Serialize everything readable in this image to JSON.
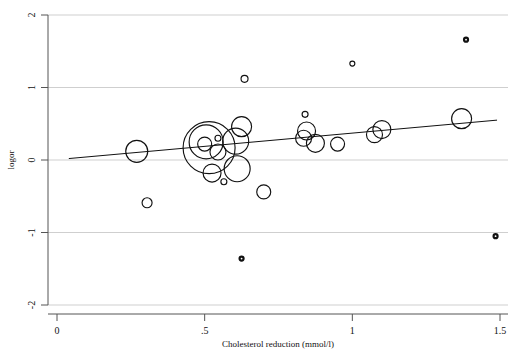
{
  "chart_data": {
    "type": "scatter",
    "title": "",
    "subtitle": "",
    "xlabel": "Cholesterol reduction (mmol/l)",
    "ylabel": "logor",
    "xlim": [
      0,
      1.5
    ],
    "ylim": [
      -2,
      2
    ],
    "xticks": [
      0,
      0.5,
      1,
      1.5
    ],
    "xticklabels": [
      "0",
      ".5",
      "1",
      "1.5"
    ],
    "yticks": [
      2,
      1,
      0,
      -1,
      -2
    ],
    "yticklabels": [
      "2",
      "1",
      "0",
      "-1",
      "-2"
    ],
    "grid": "horizontal",
    "legend": "none",
    "marker": "open-circle-bubble",
    "size_encoding": "study weight (bubble area)",
    "points": [
      {
        "x": 0.27,
        "y": 0.12,
        "size": 11.0
      },
      {
        "x": 0.305,
        "y": -0.59,
        "size": 5.0
      },
      {
        "x": 0.5,
        "y": 0.22,
        "size": 7.0
      },
      {
        "x": 0.515,
        "y": 0.17,
        "size": 26.0
      },
      {
        "x": 0.505,
        "y": 0.25,
        "size": 17.0
      },
      {
        "x": 0.545,
        "y": 0.3,
        "size": 3.0
      },
      {
        "x": 0.545,
        "y": 0.11,
        "size": 8.0
      },
      {
        "x": 0.525,
        "y": -0.18,
        "size": 9.0
      },
      {
        "x": 0.565,
        "y": -0.3,
        "size": 3.0
      },
      {
        "x": 0.605,
        "y": 0.26,
        "size": 13.0
      },
      {
        "x": 0.625,
        "y": 0.46,
        "size": 10.0
      },
      {
        "x": 0.635,
        "y": 1.12,
        "size": 3.5
      },
      {
        "x": 0.61,
        "y": -0.12,
        "size": 13.0
      },
      {
        "x": 0.625,
        "y": -1.36,
        "size": 2.0
      },
      {
        "x": 0.7,
        "y": -0.44,
        "size": 7.0
      },
      {
        "x": 0.84,
        "y": 0.63,
        "size": 3.0
      },
      {
        "x": 0.845,
        "y": 0.4,
        "size": 9.0
      },
      {
        "x": 0.835,
        "y": 0.3,
        "size": 8.0
      },
      {
        "x": 0.875,
        "y": 0.23,
        "size": 9.0
      },
      {
        "x": 0.95,
        "y": 0.22,
        "size": 7.0
      },
      {
        "x": 1.0,
        "y": 1.33,
        "size": 2.5
      },
      {
        "x": 1.075,
        "y": 0.35,
        "size": 8.0
      },
      {
        "x": 1.1,
        "y": 0.42,
        "size": 9.0
      },
      {
        "x": 1.385,
        "y": 1.66,
        "size": 2.0
      },
      {
        "x": 1.37,
        "y": 0.57,
        "size": 10.0
      },
      {
        "x": 1.485,
        "y": -1.05,
        "size": 2.0
      }
    ],
    "fit_line": {
      "label": "weighted regression line",
      "x_start": 0.04,
      "y_start": 0.02,
      "x_end": 1.49,
      "y_end": 0.55
    },
    "colors": {
      "marker_stroke": "#111111",
      "fit_line": "#111111",
      "grid": "#cfcfcf",
      "axis": "#555555",
      "background": "#ffffff"
    }
  }
}
